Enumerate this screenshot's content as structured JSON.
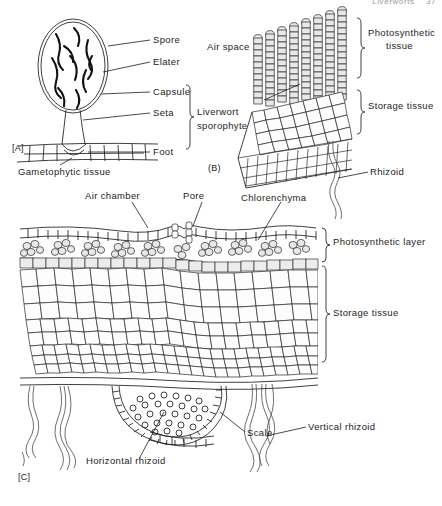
{
  "page_header": {
    "running_head": "Liverworts",
    "page_number": "37"
  },
  "figure": {
    "panels": [
      {
        "tag": "[A]",
        "name": "liverwort-sporophyte",
        "labels": [
          "Spore",
          "Elater",
          "Capsule",
          "Seta",
          "Foot",
          "Gametophytic tissue"
        ],
        "bracket_label": "Liverwort sporophyte"
      },
      {
        "tag": "[B]",
        "name": "thallus-block-section",
        "labels": [
          "Air space",
          "Rhizoid"
        ],
        "bracket_labels": [
          "Photosynthetic tissue",
          "Storage tissue"
        ]
      },
      {
        "tag": "[C]",
        "name": "thallus-cross-section",
        "labels": [
          "Air chamber",
          "Pore",
          "Chlorenchyma",
          "Scale",
          "Horizontal rhizoid",
          "Vertical rhizoid"
        ],
        "bracket_labels": [
          "Photosynthetic layer",
          "Storage tissue"
        ]
      }
    ]
  },
  "labels": {
    "spore": "Spore",
    "elater": "Elater",
    "capsule": "Capsule",
    "seta": "Seta",
    "foot": "Foot",
    "gametophytic_tissue": "Gametophytic tissue",
    "liverwort_sporophyte_line1": "Liverwort",
    "liverwort_sporophyte_line2": "sporophyte",
    "air_space": "Air space",
    "photosynthetic_tissue_line1": "Photosynthetic",
    "photosynthetic_tissue_line2": "tissue",
    "storage_tissue_b": "Storage tissue",
    "rhizoid": "Rhizoid",
    "air_chamber": "Air chamber",
    "pore": "Pore",
    "chlorenchyma": "Chlorenchyma",
    "photosynthetic_layer": "Photosynthetic layer",
    "storage_tissue_c": "Storage tissue",
    "scale": "Scale",
    "horizontal_rhizoid": "Horizontal rhizoid",
    "vertical_rhizoid": "Vertical rhizoid",
    "tag_a": "[A]",
    "tag_b": "(B)",
    "tag_c": "[C]"
  },
  "colors": {
    "ink": "#1d1d1d",
    "cell_fill": "#fdfdfd",
    "shaded_fill": "#e8e8e8",
    "rhizoid": "#4a4a4a",
    "background": "#ffffff"
  }
}
